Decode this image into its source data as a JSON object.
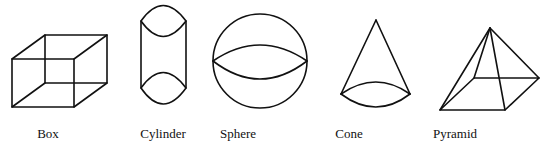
{
  "figure": {
    "shapes": [
      {
        "id": "box",
        "label": "Box",
        "label_x": 48
      },
      {
        "id": "cylinder",
        "label": "Cylinder",
        "label_x": 163
      },
      {
        "id": "sphere",
        "label": "Sphere",
        "label_x": 238
      },
      {
        "id": "cone",
        "label": "Cone",
        "label_x": 349
      },
      {
        "id": "pyramid",
        "label": "Pyramid",
        "label_x": 455
      }
    ],
    "stroke_color": "#111111",
    "background": "#ffffff"
  }
}
